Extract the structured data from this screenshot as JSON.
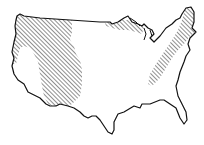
{
  "map": {
    "subject": "Contiguous United States outline",
    "style": "black line drawing with diagonal hatching",
    "colors": {
      "outline": "#111111",
      "hatch": "#222222",
      "background": "#ffffff"
    },
    "hatched_regions": [
      {
        "name": "western-mountain-region",
        "description": "Pacific Northwest through Rocky Mountain / Great Basin area down to southern border"
      },
      {
        "name": "northern-great-lakes-strip",
        "description": "Narrow band along northern border near the Great Lakes"
      },
      {
        "name": "appalachian-northeast-region",
        "description": "New England down along Appalachians"
      }
    ]
  }
}
